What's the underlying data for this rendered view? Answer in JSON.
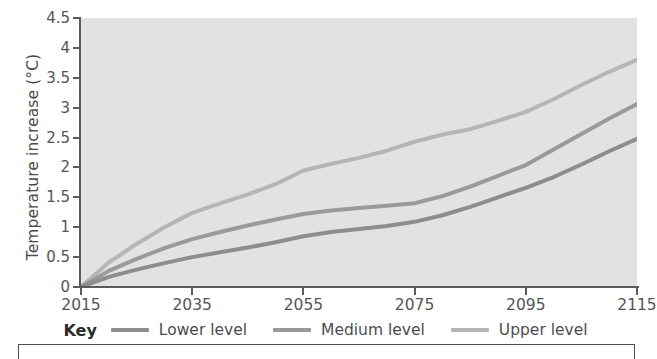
{
  "chart_data": {
    "type": "line",
    "title": "",
    "xlabel": "",
    "ylabel": "Temperature increase (°C)",
    "xlim": [
      2015,
      2115
    ],
    "ylim": [
      0,
      4.5
    ],
    "grid": false,
    "legend_position": "bottom",
    "legend_title": "Key",
    "x_ticks": [
      "2015",
      "2035",
      "2055",
      "2075",
      "2095",
      "2115"
    ],
    "y_ticks": [
      "0",
      "0.5",
      "1",
      "1.5",
      "2",
      "2.5",
      "3",
      "3.5",
      "4",
      "4.5"
    ],
    "x": [
      2015,
      2020,
      2025,
      2030,
      2035,
      2040,
      2045,
      2050,
      2055,
      2060,
      2065,
      2070,
      2075,
      2080,
      2085,
      2090,
      2095,
      2100,
      2105,
      2110,
      2115
    ],
    "series": [
      {
        "name": "Lower level",
        "color": "#8d8d8d",
        "values": [
          0,
          0.17,
          0.29,
          0.4,
          0.5,
          0.58,
          0.66,
          0.75,
          0.85,
          0.92,
          0.97,
          1.02,
          1.09,
          1.2,
          1.34,
          1.5,
          1.66,
          1.84,
          2.05,
          2.27,
          2.48
        ]
      },
      {
        "name": "Medium level",
        "color": "#9a9a9a",
        "values": [
          0,
          0.27,
          0.47,
          0.65,
          0.8,
          0.92,
          1.03,
          1.13,
          1.22,
          1.28,
          1.32,
          1.36,
          1.4,
          1.52,
          1.68,
          1.86,
          2.04,
          2.3,
          2.56,
          2.82,
          3.06
        ]
      },
      {
        "name": "Upper level",
        "color": "#b5b5b5",
        "values": [
          0,
          0.41,
          0.72,
          1.0,
          1.24,
          1.4,
          1.55,
          1.72,
          1.95,
          2.06,
          2.16,
          2.28,
          2.43,
          2.55,
          2.64,
          2.78,
          2.93,
          3.14,
          3.38,
          3.6,
          3.8
        ]
      }
    ]
  },
  "legend": {
    "key_label": "Key",
    "items": [
      {
        "label": "Lower level",
        "color": "#8d8d8d"
      },
      {
        "label": "Medium level",
        "color": "#9a9a9a"
      },
      {
        "label": "Upper level",
        "color": "#b5b5b5"
      }
    ]
  },
  "colors": {
    "plot_background": "#e2e2e2",
    "axis": "#5b5b5b",
    "tick_text": "#555555",
    "page_background": "#ffffff"
  }
}
